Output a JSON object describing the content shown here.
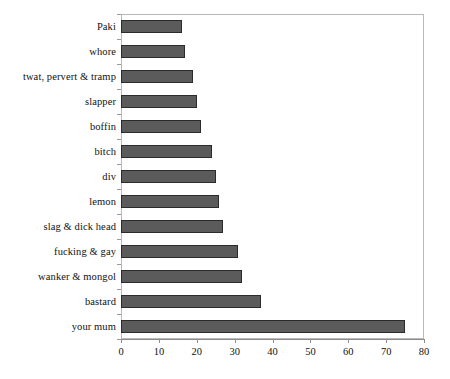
{
  "chart_data": {
    "type": "bar",
    "orientation": "horizontal",
    "title": "",
    "subtitle": "",
    "xlabel": "",
    "ylabel": "",
    "categories": [
      "Paki",
      "whore",
      "twat, pervert & tramp",
      "slapper",
      "boffin",
      "bitch",
      "div",
      "lemon",
      "slag & dick head",
      "fucking & gay",
      "wanker & mongol",
      "bastard",
      "your mum"
    ],
    "values": [
      16,
      17,
      19,
      20,
      21,
      24,
      25,
      26,
      27,
      31,
      32,
      37,
      75
    ],
    "xlim": [
      0,
      80
    ],
    "ylim": [
      0,
      13
    ],
    "xticks": [
      0,
      10,
      20,
      30,
      40,
      50,
      60,
      70,
      80
    ],
    "xtick_labels": [
      "0",
      "10",
      "20",
      "30",
      "40",
      "50",
      "60",
      "70",
      "80"
    ],
    "grid": false,
    "legend": null,
    "legend_position": "none",
    "bar_fill_color": "#5b5b5b",
    "bar_edge_color": "#2b2b2b",
    "axis_color": "#8c8c8c",
    "background_color": "#ffffff"
  }
}
